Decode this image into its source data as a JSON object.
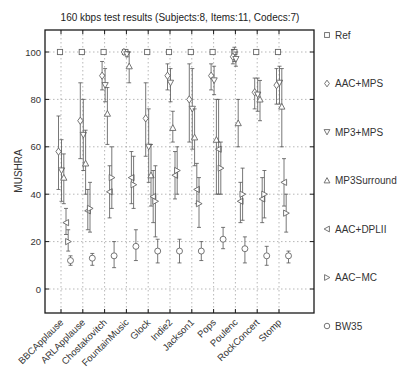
{
  "chart_data": {
    "type": "scatter",
    "subtype": "mean-with-confidence-intervals",
    "title": "160 kbps test results (Subjects:8, Items:11, Codecs:7)",
    "xlabel": "",
    "ylabel": "MUSHRA",
    "ylim": [
      -10,
      110
    ],
    "yticks": [
      0,
      20,
      40,
      60,
      80,
      100
    ],
    "grid": true,
    "legend_position": "right",
    "categories": [
      "BBCApplause",
      "ARLApplause",
      "Chostakovitch",
      "FountainMusic",
      "Glock",
      "Indie2",
      "Jackson1",
      "Pops",
      "Poulenc",
      "RockConcert",
      "Stomp"
    ],
    "series": [
      {
        "name": "Ref",
        "marker": "square",
        "values": [
          100,
          100,
          100,
          100,
          100,
          100,
          100,
          100,
          100,
          100,
          100
        ],
        "ci_low": [
          100,
          100,
          100,
          99,
          100,
          100,
          100,
          100,
          96,
          100,
          100
        ],
        "ci_high": [
          100,
          100,
          100,
          101,
          100,
          100,
          100,
          100,
          102,
          100,
          100
        ]
      },
      {
        "name": "AAC+MPS",
        "marker": "diamond",
        "values": [
          58,
          71,
          90,
          100,
          72,
          90,
          80,
          90,
          98,
          83,
          86
        ],
        "ci_low": [
          42,
          55,
          84,
          99,
          56,
          84,
          62,
          84,
          95,
          76,
          78
        ],
        "ci_high": [
          73,
          87,
          96,
          101,
          87,
          95,
          95,
          95,
          101,
          89,
          93
        ]
      },
      {
        "name": "MP3+MPS",
        "marker": "triangle-down",
        "values": [
          50,
          65,
          86,
          99,
          60,
          87,
          76,
          88,
          97,
          82,
          87
        ],
        "ci_low": [
          37,
          50,
          79,
          98,
          45,
          79,
          59,
          82,
          94,
          75,
          78
        ],
        "ci_high": [
          63,
          80,
          93,
          100,
          76,
          93,
          93,
          94,
          100,
          89,
          94
        ]
      },
      {
        "name": "MP3Surround",
        "marker": "triangle-up",
        "values": [
          47,
          53,
          74,
          94,
          48,
          68,
          64,
          63,
          70,
          80,
          77
        ],
        "ci_low": [
          36,
          40,
          61,
          87,
          35,
          62,
          52,
          40,
          60,
          71,
          60
        ],
        "ci_high": [
          57,
          67,
          85,
          100,
          61,
          75,
          76,
          80,
          80,
          88,
          93
        ]
      },
      {
        "name": "AAC+DPLII",
        "marker": "triangle-left",
        "values": [
          28,
          33,
          41,
          47,
          39,
          48,
          42,
          59,
          37,
          38,
          45
        ],
        "ci_low": [
          23,
          25,
          30,
          36,
          28,
          38,
          36,
          40,
          28,
          28,
          35
        ],
        "ci_high": [
          34,
          42,
          52,
          58,
          50,
          58,
          53,
          80,
          45,
          47,
          55
        ]
      },
      {
        "name": "AAC-MC",
        "marker": "triangle-right",
        "values": [
          20,
          34,
          47,
          44,
          37,
          50,
          36,
          51,
          40,
          40,
          32
        ],
        "ci_low": [
          16,
          24,
          34,
          34,
          22,
          40,
          26,
          40,
          29,
          30,
          24
        ],
        "ci_high": [
          25,
          45,
          60,
          56,
          52,
          60,
          47,
          62,
          51,
          50,
          40
        ]
      },
      {
        "name": "BW35",
        "marker": "circle",
        "values": [
          12,
          13,
          14,
          18,
          16,
          16,
          16,
          21,
          17,
          14,
          14
        ],
        "ci_low": [
          10,
          10,
          9,
          12,
          11,
          11,
          12,
          17,
          11,
          10,
          11
        ],
        "ci_high": [
          14,
          15,
          20,
          25,
          21,
          21,
          20,
          26,
          22,
          18,
          16
        ]
      }
    ]
  },
  "legend": {
    "items": [
      {
        "label": "Ref",
        "symbol": "□"
      },
      {
        "label": "AAC+MPS",
        "symbol": "◇"
      },
      {
        "label": "MP3+MPS",
        "symbol": "▽"
      },
      {
        "label": "MP3Surround",
        "symbol": "△"
      },
      {
        "label": "AAC+DPLII",
        "symbol": "◁"
      },
      {
        "label": "AAC−MC",
        "symbol": "▷"
      },
      {
        "label": "BW35",
        "symbol": "○"
      }
    ]
  },
  "colors": {
    "axis": "#1a1a1a",
    "marker": "#666666",
    "grid": "#9a9a9a",
    "text": "#333333"
  }
}
